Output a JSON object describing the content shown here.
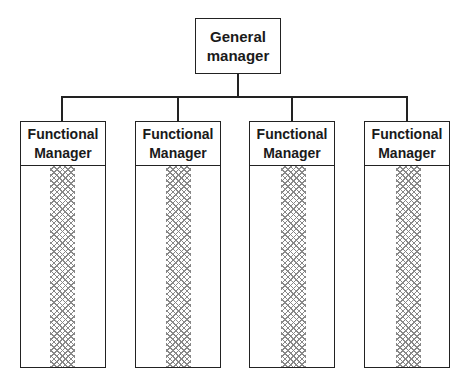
{
  "diagram": {
    "type": "functional organization chart",
    "root": {
      "label": "General\nmanager"
    },
    "children": [
      {
        "label": "Functional\nManager"
      },
      {
        "label": "Functional\nManager"
      },
      {
        "label": "Functional\nManager"
      },
      {
        "label": "Functional\nManager"
      }
    ],
    "colors": {
      "line": "#222222",
      "hatch": "#888888",
      "background": "#ffffff"
    }
  }
}
